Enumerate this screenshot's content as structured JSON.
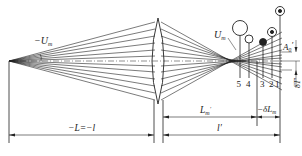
{
  "labels": {
    "neg_u_m": "−U",
    "neg_u_m_sub": "m",
    "u_m": "U",
    "u_m_sub": "m",
    "a_prime": "A",
    "a_prime_sub": "0",
    "a_prime_mark": "′",
    "delta_t": "δT′",
    "object_distance": "−L=−l",
    "image_distance_marginal": "L",
    "image_distance_marginal_sub": "m",
    "image_distance_marginal_mark": "′",
    "paraxial_distance": "l′",
    "longitudinal_aberration": "−δL",
    "longitudinal_aberration_sub": "m"
  },
  "spot_positions": [
    {
      "number": "5",
      "type": "large-open-circle"
    },
    {
      "number": "4",
      "type": "small-open-circle"
    },
    {
      "number": "3",
      "type": "filled-dot"
    },
    {
      "number": "2",
      "type": "ring-with-dot"
    },
    {
      "number": "1",
      "type": "ring-with-dot"
    }
  ],
  "colors": {
    "line": "#222222",
    "background": "#ffffff"
  }
}
